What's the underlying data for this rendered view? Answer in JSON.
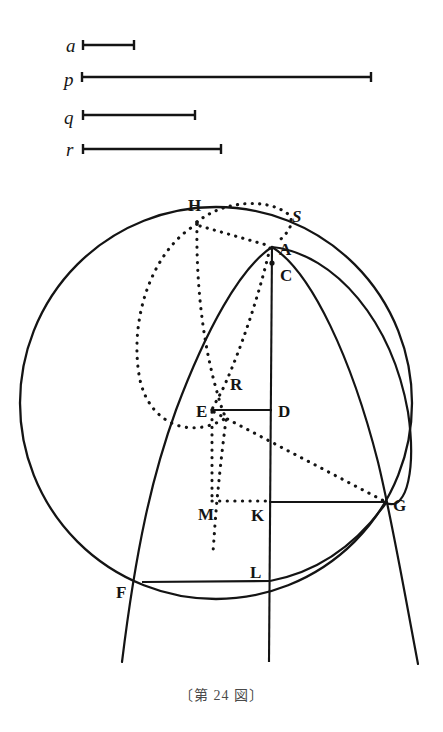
{
  "figure": {
    "caption": "〔第 24 図〕",
    "ink_color": "#141414",
    "background_color": "#ffffff",
    "segments": [
      {
        "name": "a",
        "label": "a",
        "x1": 82,
        "x2": 135,
        "y": 45
      },
      {
        "name": "p",
        "label": "p",
        "x1": 81,
        "x2": 372,
        "y": 77
      },
      {
        "name": "q",
        "label": "q",
        "x1": 82,
        "x2": 196,
        "y": 115
      },
      {
        "name": "r",
        "label": "r",
        "x1": 82,
        "x2": 222,
        "y": 149
      }
    ],
    "segment_labels": {
      "a": "a",
      "p": "p",
      "q": "q",
      "r": "r"
    },
    "points": [
      {
        "name": "H",
        "label": "H",
        "x": 197,
        "y": 222,
        "label_x": 188,
        "label_y": 211
      },
      {
        "name": "S",
        "label": "S",
        "x": 285,
        "y": 212,
        "label_x": 292,
        "label_y": 222
      },
      {
        "name": "A",
        "label": "A",
        "x": 272,
        "y": 246,
        "label_x": 279,
        "label_y": 255
      },
      {
        "name": "C",
        "label": "C",
        "x": 272,
        "y": 263,
        "label_x": 280,
        "label_y": 281
      },
      {
        "name": "R",
        "label": "R",
        "x": 226,
        "y": 374,
        "label_x": 230,
        "label_y": 390
      },
      {
        "name": "E",
        "label": "E",
        "x": 212,
        "y": 410,
        "label_x": 197,
        "label_y": 417
      },
      {
        "name": "D",
        "label": "D",
        "x": 272,
        "y": 410,
        "label_x": 278,
        "label_y": 417
      },
      {
        "name": "M",
        "label": "M",
        "x": 212,
        "y": 501,
        "label_x": 199,
        "label_y": 519
      },
      {
        "name": "K",
        "label": "K",
        "x": 269,
        "y": 501,
        "label_x": 251,
        "label_y": 520
      },
      {
        "name": "G",
        "label": "G",
        "x": 386,
        "y": 502,
        "label_x": 393,
        "label_y": 511
      },
      {
        "name": "L",
        "label": "L",
        "x": 270,
        "y": 580,
        "label_x": 251,
        "label_y": 578
      },
      {
        "name": "F",
        "label": "F",
        "x": 142,
        "y": 583,
        "label_x": 117,
        "label_y": 597
      }
    ],
    "circle": {
      "cx": 216,
      "cy": 403,
      "r": 196
    },
    "notes": {
      "solid_lines": [
        "F-L",
        "K-G",
        "A-C-D-K-L axis",
        "left parabola through F",
        "right parabola through G"
      ],
      "dotted_lines": [
        "H-A",
        "H-S-A arc",
        "H-R ellipse",
        "E-G",
        "E-M",
        "M-K",
        "A-R-E"
      ]
    }
  }
}
